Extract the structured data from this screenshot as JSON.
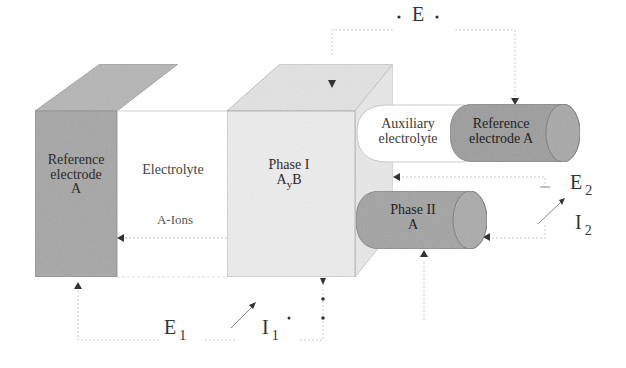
{
  "diagram": {
    "colors": {
      "reference_electrode": "#a9a9a9",
      "reference_top": "#b8b8b8",
      "phase1_front": "#ececec",
      "phase1_top": "#e2e2e2",
      "phase1_side": "#e6e6e6",
      "cylinder": "#9e9e9e",
      "wire": "#c8c8c8",
      "edge": "#8a8a8a",
      "text": "#2b2b2b"
    },
    "blocks": {
      "reference_electrode": {
        "line1": "Reference",
        "line2": "electrode",
        "line3": "A"
      },
      "electrolyte": {
        "label": "Electrolyte",
        "ions": "A-Ions"
      },
      "phase1": {
        "line1": "Phase I",
        "formula_main": "A",
        "formula_sub": "y",
        "formula_tail": "B"
      },
      "auxiliary_electrolyte": {
        "line1": "Auxiliary",
        "line2": "electrolyte"
      },
      "reference_electrode_a": {
        "line1": "Reference",
        "line2": "electrode A"
      },
      "phase2": {
        "line1": "Phase II",
        "line2": "A"
      }
    },
    "labels": {
      "E": {
        "main": "E",
        "dot": "·"
      },
      "E1": {
        "main": "E",
        "sub": "1"
      },
      "I1": {
        "main": "I",
        "sub": "1"
      },
      "E2": {
        "main": "E",
        "sub": "2"
      },
      "I2": {
        "main": "I",
        "sub": "2"
      }
    }
  }
}
